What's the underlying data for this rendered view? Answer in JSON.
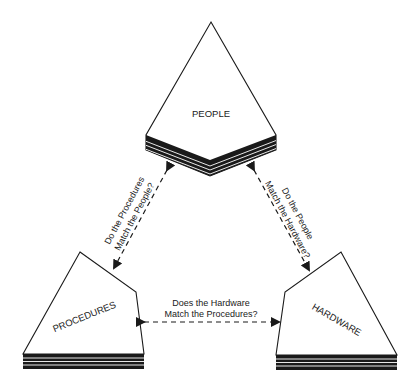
{
  "diagram": {
    "nodes": {
      "people": {
        "label": "PEOPLE"
      },
      "procedures": {
        "label": "PROCEDURES"
      },
      "hardware": {
        "label": "HARDWARE"
      }
    },
    "edges": {
      "procedures_people": {
        "line1": "Do the Procedures",
        "line2": "Match the People?"
      },
      "people_hardware": {
        "line1": "Do the People",
        "line2": "Match the Hardware?"
      },
      "hardware_procedures": {
        "line1": "Does the Hardware",
        "line2": "Match the Procedures?"
      }
    },
    "colors": {
      "ink": "#1a1a1a",
      "background": "#ffffff"
    }
  }
}
